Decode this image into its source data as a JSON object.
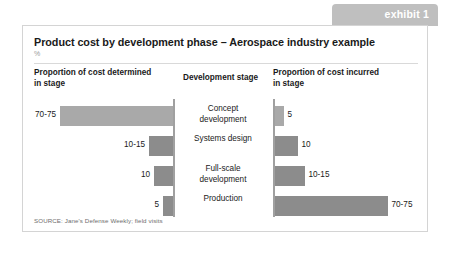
{
  "exhibit": {
    "tab_label": "exhibit 1",
    "tab_color": "#bfbfbf"
  },
  "card": {
    "title": "Product cost by development phase – Aerospace industry example",
    "subtitle": "%",
    "source": "SOURCE: Jane's Defense Weekly; field visits"
  },
  "columns": {
    "left_header": "Proportion of cost determined\nin stage",
    "middle_header": "Development stage",
    "right_header": "Proportion of cost incurred\nin stage"
  },
  "chart_data": {
    "type": "bar",
    "title": "Product cost by development phase – Aerospace industry example",
    "subtitle": "%",
    "orientation": "horizontal-diverging",
    "categories": [
      "Concept development",
      "Systems design",
      "Full-scale development",
      "Production"
    ],
    "series": [
      {
        "name": "Proportion of cost determined in stage",
        "direction": "left",
        "labels": [
          "70-75",
          "10-15",
          "10",
          "5"
        ],
        "values": [
          72.5,
          12.5,
          10,
          5
        ]
      },
      {
        "name": "Proportion of cost incurred in stage",
        "direction": "right",
        "labels": [
          "5",
          "10",
          "10-15",
          "70-75"
        ],
        "values": [
          5,
          10,
          12.5,
          72.5
        ]
      }
    ],
    "xlabel": "",
    "ylabel": "",
    "grid": false,
    "legend": "none",
    "bar_colors": {
      "large": "#a9a9a9",
      "small": "#8c8c8c"
    }
  },
  "rows": [
    {
      "stage": "Concept\ndevelopment",
      "left_label": "70-75",
      "left_width": 113,
      "left_shade": "light",
      "right_label": "5",
      "right_width": 9,
      "right_shade": "light"
    },
    {
      "stage": "Systems design",
      "left_label": "10-15",
      "left_width": 24,
      "left_shade": "dark",
      "right_label": "10",
      "right_width": 23,
      "right_shade": "dark"
    },
    {
      "stage": "Full-scale\ndevelopment",
      "left_label": "10",
      "left_width": 19,
      "left_shade": "dark",
      "right_label": "10-15",
      "right_width": 30,
      "right_shade": "dark"
    },
    {
      "stage": "Production",
      "left_label": "5",
      "left_width": 10,
      "left_shade": "dark",
      "right_label": "70-75",
      "right_width": 113,
      "right_shade": "dark"
    }
  ]
}
